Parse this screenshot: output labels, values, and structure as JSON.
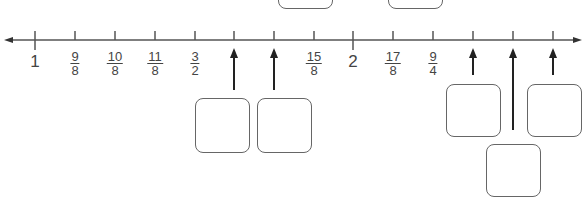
{
  "number_line": {
    "direction": "both-arrows",
    "ticks": [
      {
        "x": 35,
        "label": {
          "type": "whole",
          "text": "1"
        }
      },
      {
        "x": 75,
        "label": {
          "type": "frac",
          "num": "9",
          "den": "8"
        }
      },
      {
        "x": 115,
        "label": {
          "type": "frac",
          "num": "10",
          "den": "8"
        }
      },
      {
        "x": 155,
        "label": {
          "type": "frac",
          "num": "11",
          "den": "8"
        }
      },
      {
        "x": 195,
        "label": {
          "type": "frac",
          "num": "3",
          "den": "2"
        }
      },
      {
        "x": 234,
        "label": null
      },
      {
        "x": 274,
        "label": null
      },
      {
        "x": 314,
        "label": {
          "type": "frac",
          "num": "15",
          "den": "8"
        }
      },
      {
        "x": 353,
        "label": {
          "type": "whole",
          "text": "2"
        }
      },
      {
        "x": 393,
        "label": {
          "type": "frac",
          "num": "17",
          "den": "8"
        }
      },
      {
        "x": 433,
        "label": {
          "type": "frac",
          "num": "9",
          "den": "4"
        }
      },
      {
        "x": 473,
        "label": null
      },
      {
        "x": 513,
        "label": null
      },
      {
        "x": 553,
        "label": null
      }
    ]
  },
  "answer_boxes": [
    {
      "name": "answer-box-top-1",
      "x": 278,
      "y": -20,
      "w": 55,
      "h": 29
    },
    {
      "name": "answer-box-top-2",
      "x": 388,
      "y": -20,
      "w": 55,
      "h": 29
    },
    {
      "name": "answer-box-13-8",
      "x": 195,
      "y": 98,
      "w": 55,
      "h": 55,
      "arrow_x": 234,
      "arrow_y2": 90
    },
    {
      "name": "answer-box-14-8",
      "x": 257,
      "y": 98,
      "w": 55,
      "h": 55,
      "arrow_x": 274,
      "arrow_y2": 90
    },
    {
      "name": "answer-box-19-8",
      "x": 446,
      "y": 84,
      "w": 55,
      "h": 53,
      "arrow_x": 473,
      "arrow_y2": 75
    },
    {
      "name": "answer-box-20-8",
      "x": 486,
      "y": 144,
      "w": 55,
      "h": 53,
      "arrow_x": 513,
      "arrow_y2": 130
    },
    {
      "name": "answer-box-21-8",
      "x": 527,
      "y": 84,
      "w": 55,
      "h": 53,
      "arrow_x": 553,
      "arrow_y2": 75
    }
  ]
}
